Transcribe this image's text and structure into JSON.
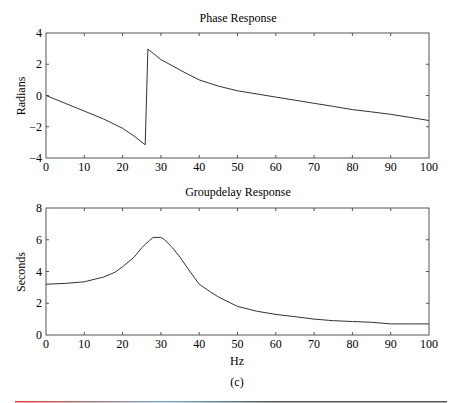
{
  "figure": {
    "caption": "(c)",
    "rule_colors": [
      "#d9443a",
      "#7ab0c8",
      "#555555"
    ]
  },
  "chart_data": [
    {
      "type": "line",
      "title": "Phase Response",
      "xlabel": "",
      "ylabel": "Radians",
      "xlim": [
        0,
        100
      ],
      "ylim": [
        -4,
        4
      ],
      "xticks": [
        0,
        10,
        20,
        30,
        40,
        50,
        60,
        70,
        80,
        90,
        100
      ],
      "yticks": [
        -4,
        -2,
        0,
        2,
        4
      ],
      "grid": false,
      "series": [
        {
          "name": "phase",
          "x": [
            0,
            2,
            5,
            10,
            15,
            20,
            23,
            25.9,
            26.6,
            28,
            30,
            33,
            36,
            40,
            45,
            50,
            55,
            60,
            65,
            70,
            75,
            80,
            85,
            90,
            95,
            100
          ],
          "y": [
            0,
            -0.2,
            -0.5,
            -1.0,
            -1.5,
            -2.1,
            -2.6,
            -3.15,
            2.97,
            2.7,
            2.3,
            1.9,
            1.5,
            1.0,
            0.6,
            0.3,
            0.1,
            -0.1,
            -0.3,
            -0.5,
            -0.7,
            -0.9,
            -1.05,
            -1.2,
            -1.4,
            -1.6
          ]
        }
      ]
    },
    {
      "type": "line",
      "title": "Groupdelay Response",
      "xlabel": "Hz",
      "ylabel": "Seconds",
      "xlim": [
        0,
        100
      ],
      "ylim": [
        0,
        8
      ],
      "xticks": [
        0,
        10,
        20,
        30,
        40,
        50,
        60,
        70,
        80,
        90,
        100
      ],
      "yticks": [
        0,
        2,
        4,
        6,
        8
      ],
      "grid": false,
      "series": [
        {
          "name": "groupdelay",
          "x": [
            0,
            5,
            10,
            15,
            18,
            20,
            23,
            25,
            27,
            28,
            30,
            31,
            33,
            35,
            37,
            40,
            43,
            45,
            50,
            55,
            60,
            65,
            70,
            75,
            80,
            85,
            90,
            95,
            100
          ],
          "y": [
            3.2,
            3.25,
            3.35,
            3.65,
            3.95,
            4.3,
            4.9,
            5.5,
            5.95,
            6.15,
            6.15,
            6.0,
            5.5,
            4.9,
            4.2,
            3.2,
            2.7,
            2.4,
            1.8,
            1.5,
            1.3,
            1.15,
            1.0,
            0.9,
            0.85,
            0.8,
            0.7,
            0.7,
            0.7
          ]
        }
      ]
    }
  ]
}
